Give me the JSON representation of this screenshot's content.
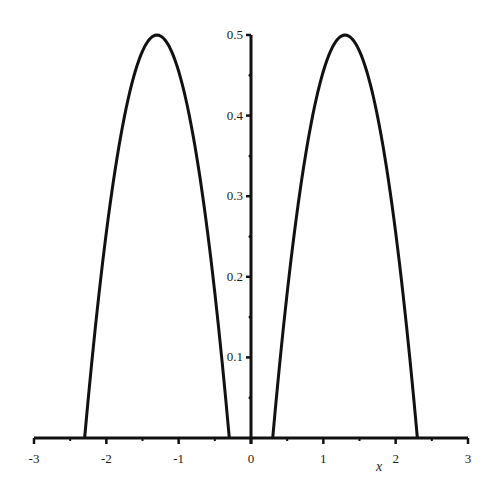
{
  "chart_data": {
    "type": "line",
    "title": "",
    "xlabel": "x",
    "ylabel": "",
    "xlim": [
      -3,
      3
    ],
    "ylim": [
      0,
      0.5
    ],
    "x_ticks": [
      -3,
      -2,
      -1,
      0,
      1,
      2,
      3
    ],
    "x_tick_labels": [
      "-3",
      "-2",
      "-1",
      "0",
      "1",
      "2",
      "3"
    ],
    "y_ticks": [
      0.1,
      0.2,
      0.3,
      0.4,
      0.5
    ],
    "y_tick_labels": [
      "0.1",
      "0.2",
      "0.3",
      "0.4",
      "0.5"
    ],
    "grid": false,
    "legend": null,
    "series": [
      {
        "name": "left-hump",
        "description": "approx 0.5*(1-(x+1.3)^2) for x in [-2.3,-0.3]",
        "x": [
          -2.3,
          -2.1,
          -1.9,
          -1.7,
          -1.5,
          -1.3,
          -1.1,
          -0.9,
          -0.7,
          -0.5,
          -0.3
        ],
        "y": [
          0.0,
          0.18,
          0.32,
          0.42,
          0.48,
          0.5,
          0.48,
          0.42,
          0.32,
          0.18,
          0.0
        ]
      },
      {
        "name": "right-hump",
        "description": "approx 0.5*(1-(x-1.3)^2) for x in [0.3,2.3]",
        "x": [
          0.3,
          0.5,
          0.7,
          0.9,
          1.1,
          1.3,
          1.5,
          1.7,
          1.9,
          2.1,
          2.3
        ],
        "y": [
          0.0,
          0.18,
          0.32,
          0.42,
          0.48,
          0.5,
          0.48,
          0.42,
          0.32,
          0.18,
          0.0
        ]
      }
    ],
    "colors": {
      "line": "#111111",
      "axis": "#111111",
      "background": "#ffffff"
    }
  }
}
